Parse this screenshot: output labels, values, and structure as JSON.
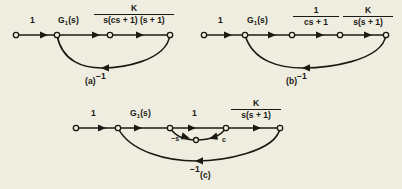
{
  "figure": {
    "type": "signal-flow-graph-set",
    "background_color": "#efece0",
    "ink_color": "#1a1a14",
    "panels": [
      {
        "id": "a",
        "caption": "(a)",
        "branch_labels": [
          {
            "text": "1",
            "kind": "plain"
          },
          {
            "text": "G",
            "subscript": "1",
            "suffix": "(s)",
            "kind": "subscripted"
          }
        ],
        "fraction": {
          "numerator": "K",
          "denominator": "s(cs + 1) (s + 1)"
        },
        "feedback_label": "−1",
        "node_count": 4
      },
      {
        "id": "b",
        "caption": "(b)",
        "branch_labels": [
          {
            "text": "1",
            "kind": "plain"
          },
          {
            "text": "G",
            "subscript": "1",
            "suffix": "(s)",
            "kind": "subscripted"
          }
        ],
        "fractions": [
          {
            "numerator": "1",
            "denominator": "cs + 1"
          },
          {
            "numerator": "K",
            "denominator": "s(s + 1)"
          }
        ],
        "feedback_label": "−1",
        "node_count": 5
      },
      {
        "id": "c",
        "caption": "(c)",
        "branch_labels": [
          {
            "text": "1",
            "kind": "plain"
          },
          {
            "text": "G",
            "subscript": "1",
            "suffix": "(s)",
            "kind": "subscripted"
          },
          {
            "text": "1",
            "kind": "plain"
          }
        ],
        "fraction": {
          "numerator": "K",
          "denominator": "s(s + 1)"
        },
        "inner_loop_labels": [
          "−s",
          "c"
        ],
        "feedback_label": "−1",
        "node_count": 6
      }
    ]
  }
}
